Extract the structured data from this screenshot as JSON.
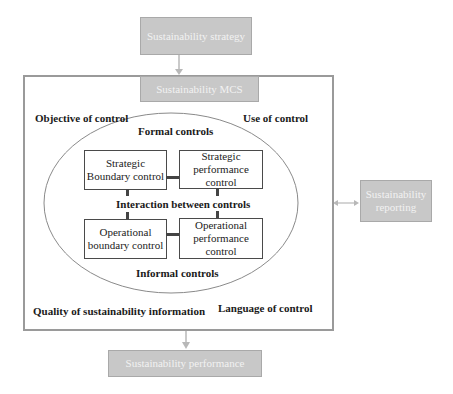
{
  "diagram": {
    "strategy_box": "Sustainability strategy",
    "mcs_header": "Sustainability MCS",
    "reporting_box": "Sustainability reporting",
    "performance_box": "Sustainability performance",
    "corner_labels": {
      "top_left": "Objective of control",
      "top_right": "Use of control",
      "bottom_left": "Quality of sustainability information",
      "bottom_right": "Language of control"
    },
    "ellipse_labels": {
      "top": "Formal controls",
      "middle": "Interaction between controls",
      "bottom": "Informal controls"
    },
    "controls": {
      "strategic_boundary": "Strategic Boundary control",
      "strategic_performance": "Strategic performance control",
      "operational_boundary": "Operational boundary control",
      "operational_performance": "Operational performance control"
    },
    "colors": {
      "grey_box_fill": "#c8c8c8",
      "grey_box_text": "#f2f2f2",
      "frame_border": "#9a9a9a",
      "connector": "#444444",
      "arrow": "#b8b8b8"
    }
  }
}
